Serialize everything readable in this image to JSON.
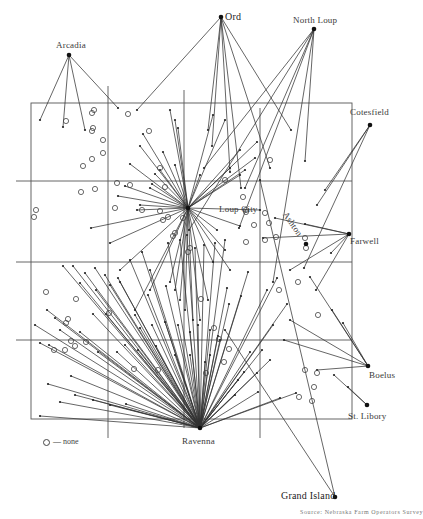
{
  "map": {
    "title": "",
    "boundary": {
      "x": 31,
      "y": 103,
      "w": 321,
      "h": 316
    },
    "grid": {
      "vertical": [
        {
          "x": 108,
          "y1": 86,
          "y2": 438
        },
        {
          "x": 184,
          "y1": 90,
          "y2": 428
        },
        {
          "x": 260,
          "y1": 108,
          "y2": 438
        }
      ],
      "horizontal": [
        {
          "y": 181,
          "x1": 16,
          "x2": 352
        },
        {
          "y": 262,
          "x1": 16,
          "x2": 352
        },
        {
          "y": 340,
          "x1": 16,
          "x2": 352
        }
      ]
    },
    "towns": [
      {
        "name": "Arcadia",
        "x": 69,
        "y": 55,
        "lx": 56,
        "ly": 40,
        "size": "normal"
      },
      {
        "name": "Ord",
        "x": 221,
        "y": 17,
        "lx": 225,
        "ly": 11,
        "size": "big"
      },
      {
        "name": "North Loup",
        "x": 314,
        "y": 29,
        "lx": 293,
        "ly": 15,
        "size": "normal"
      },
      {
        "name": "Cotesfield",
        "x": 370,
        "y": 125,
        "lx": 350,
        "ly": 107,
        "size": "normal"
      },
      {
        "name": "Loup City",
        "x": 188,
        "y": 208,
        "lx": 219,
        "ly": 204,
        "size": "normal"
      },
      {
        "name": "Farwell",
        "x": 349,
        "y": 234,
        "lx": 350,
        "ly": 236,
        "size": "normal"
      },
      {
        "name": "Ashton",
        "x": 306,
        "y": 244,
        "lx": 289,
        "ly": 210,
        "size": "normal",
        "rotate": 55
      },
      {
        "name": "Boelus",
        "x": 368,
        "y": 366,
        "lx": 369,
        "ly": 370,
        "size": "normal"
      },
      {
        "name": "St. Libory",
        "x": 367,
        "y": 405,
        "lx": 348,
        "ly": 411,
        "size": "normal"
      },
      {
        "name": "Ravenna",
        "x": 200,
        "y": 428,
        "lx": 182,
        "ly": 436,
        "size": "normal"
      },
      {
        "name": "Grand Island",
        "x": 335,
        "y": 497,
        "lx": 281,
        "ly": 490,
        "size": "big"
      }
    ],
    "legend": {
      "symbol": "○",
      "text": "— none"
    },
    "caption": "Source: Nebraska Farm Operators Survey",
    "none_farms": [
      [
        92,
        113
      ],
      [
        94,
        110
      ],
      [
        66,
        121
      ],
      [
        36,
        210
      ],
      [
        34,
        217
      ],
      [
        93,
        128
      ],
      [
        92,
        131
      ],
      [
        92,
        159
      ],
      [
        128,
        114
      ],
      [
        149,
        131
      ],
      [
        83,
        166
      ],
      [
        103,
        140
      ],
      [
        103,
        153
      ],
      [
        117,
        183
      ],
      [
        115,
        208
      ],
      [
        81,
        192
      ],
      [
        95,
        189
      ],
      [
        130,
        185
      ],
      [
        160,
        168
      ],
      [
        165,
        187
      ],
      [
        142,
        210
      ],
      [
        160,
        211
      ],
      [
        168,
        217
      ],
      [
        163,
        220
      ],
      [
        173,
        236
      ],
      [
        183,
        218
      ],
      [
        175,
        233
      ],
      [
        190,
        248
      ],
      [
        188,
        252
      ],
      [
        225,
        180
      ],
      [
        243,
        197
      ],
      [
        246,
        212
      ],
      [
        246,
        210
      ],
      [
        270,
        160
      ],
      [
        265,
        213
      ],
      [
        269,
        223
      ],
      [
        254,
        225
      ],
      [
        246,
        242
      ],
      [
        265,
        240
      ],
      [
        276,
        237
      ],
      [
        305,
        238
      ],
      [
        279,
        290
      ],
      [
        298,
        282
      ],
      [
        318,
        315
      ],
      [
        214,
        328
      ],
      [
        219,
        339
      ],
      [
        224,
        362
      ],
      [
        305,
        370
      ],
      [
        317,
        373
      ],
      [
        314,
        387
      ],
      [
        299,
        397
      ],
      [
        312,
        401
      ],
      [
        46,
        292
      ],
      [
        76,
        299
      ],
      [
        68,
        319
      ],
      [
        66,
        323
      ],
      [
        71,
        341
      ],
      [
        75,
        346
      ],
      [
        65,
        350
      ],
      [
        54,
        350
      ],
      [
        109,
        313
      ],
      [
        134,
        369
      ],
      [
        158,
        370
      ],
      [
        86,
        342
      ],
      [
        201,
        299
      ],
      [
        229,
        349
      ],
      [
        206,
        373
      ],
      [
        306,
        248
      ]
    ],
    "hubs": {
      "Arcadia": [
        [
          40,
          120
        ],
        [
          63,
          127
        ],
        [
          85,
          130
        ],
        [
          118,
          108
        ]
      ],
      "Ord": [
        [
          137,
          110
        ],
        [
          208,
          130
        ],
        [
          241,
          188
        ],
        [
          270,
          168
        ],
        [
          291,
          130
        ],
        [
          212,
          146
        ],
        [
          230,
          172
        ]
      ],
      "North Loup": [
        [
          273,
          282
        ],
        [
          305,
          161
        ],
        [
          245,
          188
        ],
        [
          204,
          168
        ],
        [
          239,
          228
        ],
        [
          189,
          230
        ]
      ],
      "Cotesfield": [
        [
          317,
          205
        ],
        [
          325,
          190
        ],
        [
          304,
          268
        ]
      ],
      "Farwell": [
        [
          275,
          218
        ],
        [
          305,
          224
        ],
        [
          290,
          270
        ],
        [
          316,
          290
        ],
        [
          331,
          253
        ],
        [
          263,
          238
        ]
      ],
      "Boelus": [
        [
          290,
          320
        ],
        [
          332,
          310
        ],
        [
          310,
          277
        ],
        [
          343,
          323
        ],
        [
          284,
          340
        ],
        [
          317,
          370
        ]
      ],
      "Grand Island": [
        [
          260,
          180
        ],
        [
          225,
          330
        ]
      ],
      "St. Libory": [
        [
          334,
          375
        ],
        [
          348,
          387
        ]
      ],
      "LoupCity": [
        [
          140,
          146
        ],
        [
          143,
          134
        ],
        [
          152,
          184
        ],
        [
          160,
          170
        ],
        [
          155,
          174
        ],
        [
          163,
          152
        ],
        [
          170,
          110
        ],
        [
          175,
          120
        ],
        [
          178,
          128
        ],
        [
          137,
          210
        ],
        [
          118,
          196
        ],
        [
          125,
          186
        ],
        [
          175,
          165
        ],
        [
          140,
          205
        ],
        [
          91,
          228
        ],
        [
          130,
          164
        ],
        [
          150,
          188
        ],
        [
          213,
          115
        ],
        [
          225,
          120
        ],
        [
          240,
          150
        ],
        [
          257,
          142
        ],
        [
          255,
          158
        ],
        [
          230,
          168
        ],
        [
          240,
          175
        ],
        [
          245,
          170
        ],
        [
          200,
          175
        ],
        [
          240,
          226
        ],
        [
          230,
          270
        ],
        [
          225,
          250
        ],
        [
          213,
          262
        ],
        [
          208,
          300
        ],
        [
          200,
          320
        ],
        [
          193,
          320
        ],
        [
          185,
          310
        ],
        [
          180,
          300
        ],
        [
          175,
          290
        ],
        [
          170,
          282
        ],
        [
          150,
          290
        ],
        [
          135,
          310
        ],
        [
          120,
          270
        ],
        [
          217,
          230
        ],
        [
          260,
          210
        ],
        [
          110,
          243
        ]
      ],
      "Ravenna": [
        [
          63,
          266
        ],
        [
          73,
          266
        ],
        [
          85,
          273
        ],
        [
          95,
          268
        ],
        [
          105,
          275
        ],
        [
          110,
          285
        ],
        [
          118,
          278
        ],
        [
          96,
          290
        ],
        [
          80,
          283
        ],
        [
          93,
          314
        ],
        [
          106,
          314
        ],
        [
          120,
          282
        ],
        [
          135,
          315
        ],
        [
          152,
          325
        ],
        [
          165,
          322
        ],
        [
          178,
          325
        ],
        [
          190,
          332
        ],
        [
          198,
          325
        ],
        [
          210,
          330
        ],
        [
          218,
          336
        ],
        [
          47,
          310
        ],
        [
          55,
          318
        ],
        [
          35,
          325
        ],
        [
          40,
          343
        ],
        [
          49,
          345
        ],
        [
          60,
          330
        ],
        [
          80,
          332
        ],
        [
          98,
          352
        ],
        [
          117,
          352
        ],
        [
          125,
          345
        ],
        [
          138,
          350
        ],
        [
          71,
          376
        ],
        [
          48,
          384
        ],
        [
          75,
          395
        ],
        [
          93,
          400
        ],
        [
          110,
          405
        ],
        [
          126,
          404
        ],
        [
          40,
          416
        ],
        [
          60,
          402
        ],
        [
          229,
          304
        ],
        [
          241,
          296
        ],
        [
          248,
          272
        ],
        [
          227,
          288
        ],
        [
          277,
          278
        ],
        [
          267,
          290
        ],
        [
          287,
          304
        ],
        [
          273,
          325
        ],
        [
          244,
          372
        ],
        [
          257,
          373
        ],
        [
          296,
          393
        ],
        [
          280,
          398
        ],
        [
          270,
          360
        ],
        [
          262,
          350
        ],
        [
          250,
          352
        ],
        [
          210,
          355
        ],
        [
          220,
          340
        ],
        [
          148,
          295
        ],
        [
          140,
          328
        ],
        [
          156,
          346
        ],
        [
          175,
          355
        ],
        [
          190,
          355
        ],
        [
          166,
          286
        ],
        [
          150,
          270
        ],
        [
          130,
          260
        ],
        [
          142,
          252
        ],
        [
          168,
          243
        ],
        [
          180,
          240
        ],
        [
          187,
          235
        ],
        [
          195,
          248
        ],
        [
          204,
          245
        ],
        [
          215,
          243
        ],
        [
          225,
          240
        ],
        [
          258,
          392
        ],
        [
          235,
          395
        ],
        [
          238,
          380
        ],
        [
          205,
          362
        ]
      ]
    }
  }
}
